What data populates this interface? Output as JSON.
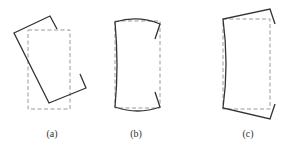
{
  "figure": {
    "panels": [
      {
        "id": "a",
        "label": "(a)",
        "description": "channel section rotated (rigid rotation)"
      },
      {
        "id": "b",
        "label": "(b)",
        "description": "channel section with flanges bowed (distortional)"
      },
      {
        "id": "c",
        "label": "(c)",
        "description": "channel section with flanges flared outward"
      }
    ],
    "legend": {
      "solid": "deformed shape",
      "dashed": "original shape"
    },
    "colors": {
      "solid_line": "#333333",
      "dashed_line": "#999999"
    }
  }
}
